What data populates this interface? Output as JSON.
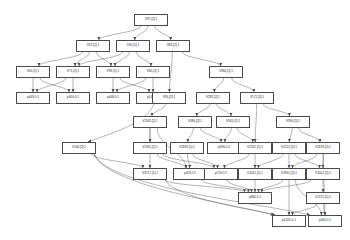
{
  "diagram": {
    "type": "directed-acyclic-graph",
    "renderer": "graphviz-dot",
    "background_color": "#ffffff",
    "node_fill_color": "#ffffff",
    "node_border_color": "#4a4a4a",
    "edge_color": "#5a5a5a",
    "node_count": 38,
    "edge_count": 72,
    "nodes": [
      {
        "id": "n0",
        "label": "V92.[2]:1",
        "x": 134,
        "y": 14,
        "w": 34,
        "h": 12
      },
      {
        "id": "n1",
        "label": "V22.[2]:1",
        "x": 76,
        "y": 40,
        "w": 34,
        "h": 12
      },
      {
        "id": "n2",
        "label": "V30.[1]:1",
        "x": 116,
        "y": 40,
        "w": 34,
        "h": 12
      },
      {
        "id": "n3",
        "label": "V83.[2]:1",
        "x": 156,
        "y": 40,
        "w": 34,
        "h": 12
      },
      {
        "id": "n4",
        "label": "V40.[1]:1",
        "x": 16,
        "y": 66,
        "w": 34,
        "h": 12
      },
      {
        "id": "n5",
        "label": "V71.[2]:1",
        "x": 56,
        "y": 66,
        "w": 34,
        "h": 12
      },
      {
        "id": "n6",
        "label": "V96.[1]:1",
        "x": 96,
        "y": 66,
        "w": 34,
        "h": 12
      },
      {
        "id": "n7",
        "label": "V60.[2]:1",
        "x": 136,
        "y": 66,
        "w": 34,
        "h": 12
      },
      {
        "id": "n8",
        "label": "V384.[1]:1",
        "x": 209,
        "y": 66,
        "w": 34,
        "h": 12
      },
      {
        "id": "n9",
        "label": "p403.0:1",
        "x": 16,
        "y": 92,
        "w": 34,
        "h": 12
      },
      {
        "id": "n10",
        "label": "p300.0:1",
        "x": 56,
        "y": 92,
        "w": 34,
        "h": 12
      },
      {
        "id": "n11",
        "label": "p408.0:1",
        "x": 96,
        "y": 92,
        "w": 34,
        "h": 12
      },
      {
        "id": "n12",
        "label": "p105.0:1",
        "x": 136,
        "y": 92,
        "w": 34,
        "h": 12
      },
      {
        "id": "n13",
        "label": "V90.[2]:1",
        "x": 152,
        "y": 92,
        "w": 34,
        "h": 12
      },
      {
        "id": "n14",
        "label": "V282.[2]:1",
        "x": 196,
        "y": 92,
        "w": 34,
        "h": 12
      },
      {
        "id": "n15",
        "label": "V172.[2]:1",
        "x": 240,
        "y": 92,
        "w": 34,
        "h": 12
      },
      {
        "id": "n16",
        "label": "V1182.[2]:1",
        "x": 133,
        "y": 116,
        "w": 34,
        "h": 12
      },
      {
        "id": "n17",
        "label": "V386.[2]:1",
        "x": 178,
        "y": 116,
        "w": 34,
        "h": 12
      },
      {
        "id": "n18",
        "label": "V345.[1]:1",
        "x": 216,
        "y": 116,
        "w": 34,
        "h": 12
      },
      {
        "id": "n19",
        "label": "V390.[1]:1",
        "x": 276,
        "y": 116,
        "w": 34,
        "h": 12
      },
      {
        "id": "n20",
        "label": "V146.[2]:1",
        "x": 62,
        "y": 142,
        "w": 34,
        "h": 12
      },
      {
        "id": "n21",
        "label": "V1181.[1]:1",
        "x": 133,
        "y": 142,
        "w": 34,
        "h": 12
      },
      {
        "id": "n22",
        "label": "V3183.[1]:1",
        "x": 170,
        "y": 142,
        "w": 34,
        "h": 12
      },
      {
        "id": "n23",
        "label": "p390.0:1",
        "x": 207,
        "y": 142,
        "w": 34,
        "h": 12
      },
      {
        "id": "n24",
        "label": "V2762.[2]:1",
        "x": 238,
        "y": 142,
        "w": 34,
        "h": 12
      },
      {
        "id": "n25",
        "label": "V2122.[2]:1",
        "x": 272,
        "y": 142,
        "w": 34,
        "h": 12
      },
      {
        "id": "n26",
        "label": "V3193.[2]:1",
        "x": 306,
        "y": 142,
        "w": 34,
        "h": 12
      },
      {
        "id": "n27",
        "label": "V3712.[1]:1",
        "x": 133,
        "y": 168,
        "w": 34,
        "h": 12
      },
      {
        "id": "n28",
        "label": "p403.0:1",
        "x": 173,
        "y": 168,
        "w": 34,
        "h": 12
      },
      {
        "id": "n29",
        "label": "p720.0:1",
        "x": 204,
        "y": 168,
        "w": 34,
        "h": 12
      },
      {
        "id": "n30",
        "label": "V2441.[1]:1",
        "x": 238,
        "y": 168,
        "w": 34,
        "h": 12
      },
      {
        "id": "n31",
        "label": "V2901.[2]:1",
        "x": 272,
        "y": 168,
        "w": 34,
        "h": 12
      },
      {
        "id": "n32",
        "label": "V3002.[2]:1",
        "x": 306,
        "y": 168,
        "w": 34,
        "h": 12
      },
      {
        "id": "n33",
        "label": "p860.0:1",
        "x": 238,
        "y": 192,
        "w": 34,
        "h": 12
      },
      {
        "id": "n34",
        "label": "V2751.[1]:1",
        "x": 306,
        "y": 192,
        "w": 34,
        "h": 12
      },
      {
        "id": "n35",
        "label": "p1005.0:1",
        "x": 272,
        "y": 215,
        "w": 34,
        "h": 12
      },
      {
        "id": "n36",
        "label": "p460.0:1",
        "x": 308,
        "y": 215,
        "w": 34,
        "h": 12
      }
    ],
    "edges": [
      {
        "from": "n0",
        "to": "n1"
      },
      {
        "from": "n0",
        "to": "n2"
      },
      {
        "from": "n0",
        "to": "n3"
      },
      {
        "from": "n1",
        "to": "n4"
      },
      {
        "from": "n1",
        "to": "n5"
      },
      {
        "from": "n1",
        "to": "n6"
      },
      {
        "from": "n2",
        "to": "n5"
      },
      {
        "from": "n2",
        "to": "n6"
      },
      {
        "from": "n2",
        "to": "n7"
      },
      {
        "from": "n3",
        "to": "n13"
      },
      {
        "from": "n3",
        "to": "n8"
      },
      {
        "from": "n4",
        "to": "n9"
      },
      {
        "from": "n4",
        "to": "n10"
      },
      {
        "from": "n5",
        "to": "n9"
      },
      {
        "from": "n5",
        "to": "n10"
      },
      {
        "from": "n6",
        "to": "n11"
      },
      {
        "from": "n6",
        "to": "n12"
      },
      {
        "from": "n7",
        "to": "n11"
      },
      {
        "from": "n7",
        "to": "n12"
      },
      {
        "from": "n8",
        "to": "n14"
      },
      {
        "from": "n8",
        "to": "n15"
      },
      {
        "from": "n13",
        "to": "n16"
      },
      {
        "from": "n13",
        "to": "n20"
      },
      {
        "from": "n14",
        "to": "n17"
      },
      {
        "from": "n14",
        "to": "n18"
      },
      {
        "from": "n15",
        "to": "n24"
      },
      {
        "from": "n15",
        "to": "n19"
      },
      {
        "from": "n16",
        "to": "n21"
      },
      {
        "from": "n16",
        "to": "n27"
      },
      {
        "from": "n16",
        "to": "n28"
      },
      {
        "from": "n17",
        "to": "n22"
      },
      {
        "from": "n17",
        "to": "n23"
      },
      {
        "from": "n18",
        "to": "n23"
      },
      {
        "from": "n18",
        "to": "n24"
      },
      {
        "from": "n19",
        "to": "n25"
      },
      {
        "from": "n19",
        "to": "n26"
      },
      {
        "from": "n20",
        "to": "n27"
      },
      {
        "from": "n20",
        "to": "n35"
      },
      {
        "from": "n20",
        "to": "n36"
      },
      {
        "from": "n21",
        "to": "n28"
      },
      {
        "from": "n21",
        "to": "n29"
      },
      {
        "from": "n22",
        "to": "n28"
      },
      {
        "from": "n22",
        "to": "n29"
      },
      {
        "from": "n24",
        "to": "n29"
      },
      {
        "from": "n24",
        "to": "n30"
      },
      {
        "from": "n25",
        "to": "n30"
      },
      {
        "from": "n25",
        "to": "n31"
      },
      {
        "from": "n25",
        "to": "n32"
      },
      {
        "from": "n26",
        "to": "n31"
      },
      {
        "from": "n26",
        "to": "n32"
      },
      {
        "from": "n26",
        "to": "n36"
      },
      {
        "from": "n27",
        "to": "n33"
      },
      {
        "from": "n27",
        "to": "n35"
      },
      {
        "from": "n28",
        "to": "n33"
      },
      {
        "from": "n29",
        "to": "n33"
      },
      {
        "from": "n30",
        "to": "n33"
      },
      {
        "from": "n31",
        "to": "n33"
      },
      {
        "from": "n31",
        "to": "n35"
      },
      {
        "from": "n32",
        "to": "n33"
      },
      {
        "from": "n32",
        "to": "n34"
      },
      {
        "from": "n34",
        "to": "n35"
      },
      {
        "from": "n34",
        "to": "n36"
      },
      {
        "from": "n31",
        "to": "n36"
      }
    ]
  }
}
